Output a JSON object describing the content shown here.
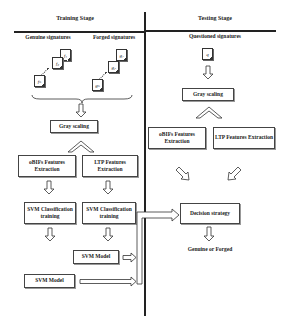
{
  "training": {
    "title": "Training Stage",
    "genuine_label": "Genuine signatures",
    "forged_label": "Forged signatures",
    "genuine_docs": [
      "f₁",
      "f₂",
      "fₙ"
    ],
    "forged_docs": [
      "g₁",
      "g₂",
      "gₙ"
    ],
    "gray_scaling": "Gray scaling",
    "obif_extraction": "oBIFs Features Extraction",
    "ltp_extraction": "LTP Features Extraction",
    "svm_training_1": "SVM Classification training",
    "svm_training_2": "SVM Classification training",
    "svm_model_1": "SVM Model",
    "svm_model_2": "SVM Model"
  },
  "testing": {
    "title": "Testing Stage",
    "questioned_label": "Questioned signatures",
    "questioned_doc": "q",
    "gray_scaling": "Gray scaling",
    "obif_extraction": "oBIFs Features Extraction",
    "ltp_extraction": "LTP Features Extraction",
    "decision": "Decision strategy",
    "outcome": "Genuine or Forged"
  }
}
